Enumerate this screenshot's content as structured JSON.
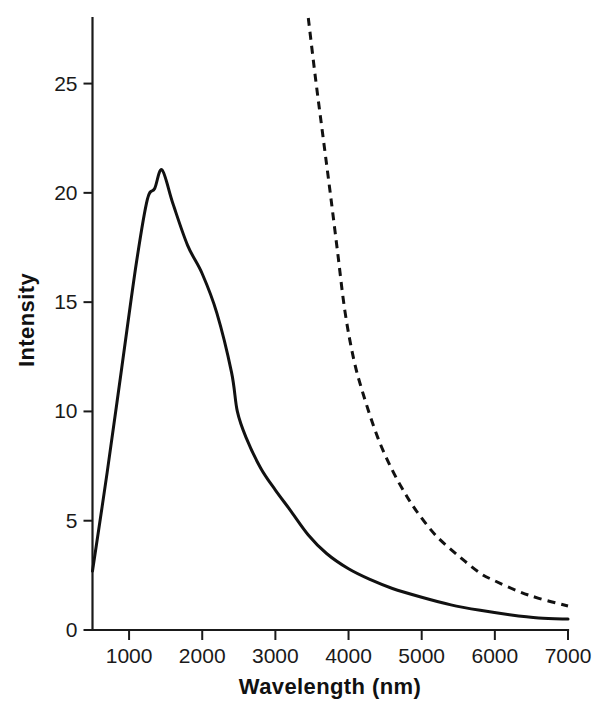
{
  "chart_data": {
    "type": "line",
    "title": "",
    "xlabel": "Wavelength (nm)",
    "ylabel": "Intensity",
    "xlim": [
      500,
      7000
    ],
    "ylim": [
      0,
      28
    ],
    "grid": false,
    "legend": "none",
    "xticks": [
      1000,
      2000,
      3000,
      4000,
      5000,
      6000,
      7000
    ],
    "xtick_labels": [
      "1000",
      "2000",
      "3000",
      "4000",
      "5000",
      "6000",
      "7000"
    ],
    "yticks": [
      0,
      5,
      10,
      15,
      20,
      25
    ],
    "ytick_labels": [
      "0",
      "5",
      "10",
      "15",
      "20",
      "25"
    ],
    "series": [
      {
        "name": "solid-curve",
        "style": "solid",
        "color": "#111111",
        "x": [
          500,
          700,
          900,
          1100,
          1250,
          1350,
          1450,
          1600,
          1800,
          2000,
          2200,
          2400,
          2480,
          2600,
          2800,
          3000,
          3200,
          3450,
          3700,
          4000,
          4300,
          4600,
          5000,
          5400,
          5800,
          6200,
          6600,
          7000
        ],
        "y": [
          2.7,
          7.2,
          12.0,
          16.8,
          19.7,
          20.2,
          21.05,
          19.5,
          17.6,
          16.3,
          14.5,
          11.8,
          10.0,
          8.8,
          7.4,
          6.4,
          5.5,
          4.35,
          3.5,
          2.8,
          2.3,
          1.9,
          1.5,
          1.15,
          0.9,
          0.7,
          0.55,
          0.5
        ]
      },
      {
        "name": "dashed-curve",
        "style": "dashed",
        "color": "#111111",
        "x": [
          3450,
          3550,
          3650,
          3750,
          3850,
          3950,
          4070,
          4200,
          4400,
          4600,
          4800,
          4960,
          5200,
          5500,
          5800,
          6000,
          6300,
          6600,
          7000
        ],
        "y": [
          28.0,
          25.2,
          22.6,
          20.0,
          17.3,
          14.6,
          12.4,
          10.8,
          8.8,
          7.3,
          6.1,
          5.3,
          4.3,
          3.4,
          2.6,
          2.25,
          1.8,
          1.45,
          1.1
        ]
      }
    ]
  }
}
